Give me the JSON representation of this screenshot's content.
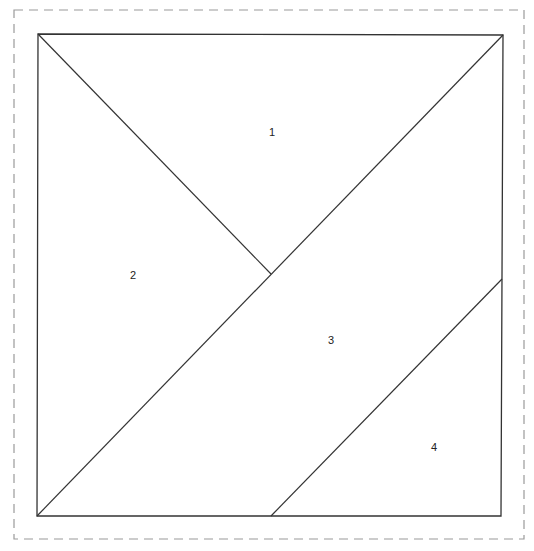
{
  "diagram": {
    "type": "tangram-square-partition",
    "border": {
      "style": "dashed",
      "color": "#9a9a9a",
      "x": 14,
      "y": 10,
      "width": 510,
      "height": 529
    },
    "square": {
      "color": "#333333",
      "x1": 38,
      "y1": 34,
      "x2": 502,
      "y2": 516
    },
    "lines": [
      {
        "name": "diagonal-top-left",
        "x1": 38,
        "y1": 34,
        "x2": 271,
        "y2": 274
      },
      {
        "name": "diagonal-main",
        "x1": 37,
        "y1": 516,
        "x2": 503,
        "y2": 35
      },
      {
        "name": "parallel-bottom-right",
        "x1": 271,
        "y1": 516,
        "x2": 502,
        "y2": 279
      }
    ],
    "pieces": [
      {
        "label": "1",
        "x": 272,
        "y": 136
      },
      {
        "label": "2",
        "x": 133,
        "y": 279
      },
      {
        "label": "3",
        "x": 331,
        "y": 344
      },
      {
        "label": "4",
        "x": 434,
        "y": 451
      }
    ]
  }
}
